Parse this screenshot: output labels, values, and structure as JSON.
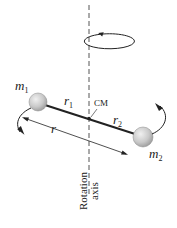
{
  "diagram": {
    "labels": {
      "m1": "m",
      "m1_sub": "1",
      "m2": "m",
      "m2_sub": "2",
      "r1": "r",
      "r1_sub": "1",
      "r2": "r",
      "r2_sub": "2",
      "r": "r",
      "cm": "CM",
      "axis_line1": "Rotation",
      "axis_line2": "axis"
    },
    "colors": {
      "line": "#222222",
      "ball_fill": "#c8c8c8",
      "ball_highlight": "#ececec",
      "axis_dash": "#555555"
    }
  }
}
